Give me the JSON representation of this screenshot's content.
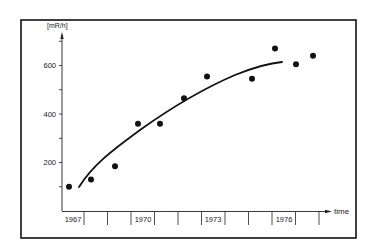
{
  "chart_data": {
    "type": "scatter",
    "title": "",
    "xlabel": "time",
    "ylabel": "[mR/h]",
    "x_tick_labels": [
      "1967",
      "1970",
      "1973",
      "1976"
    ],
    "y_tick_labels": [
      "200",
      "400",
      "600"
    ],
    "xlim": [
      1967,
      1978
    ],
    "ylim": [
      0,
      750
    ],
    "grid": false,
    "legend": null,
    "series": [
      {
        "name": "measurements",
        "type": "scatter",
        "x": [
          1967,
          1968,
          1969,
          1970,
          1971,
          1972,
          1973,
          1975,
          1976,
          1977,
          1978
        ],
        "y": [
          100,
          130,
          185,
          360,
          360,
          465,
          555,
          545,
          670,
          605,
          640
        ]
      },
      {
        "name": "trend",
        "type": "line",
        "x": [
          1967.4,
          1968,
          1969,
          1970,
          1971,
          1972,
          1973,
          1974,
          1975,
          1976.2
        ],
        "y": [
          100,
          175,
          270,
          345,
          410,
          465,
          515,
          555,
          590,
          615
        ]
      }
    ]
  }
}
